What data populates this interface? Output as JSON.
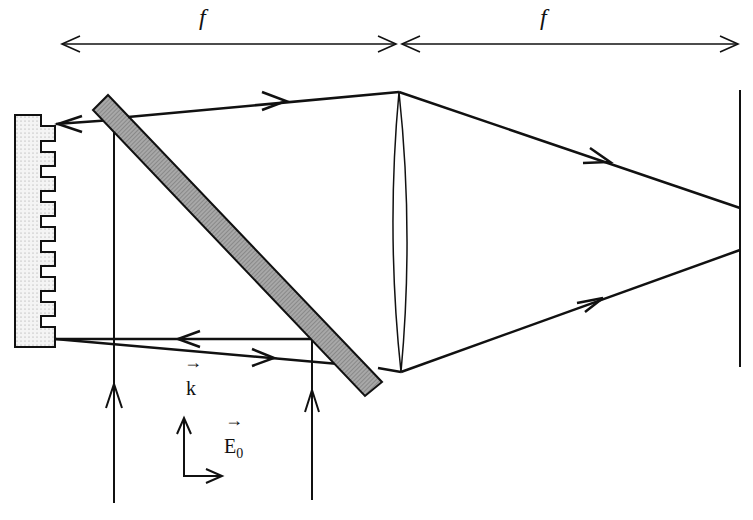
{
  "diagram": {
    "labels": {
      "focal_left": "f",
      "focal_right": "f",
      "wave_vector": "k",
      "field_amplitude": "E",
      "field_subscript": "0",
      "vector_arrow": "→"
    },
    "components": [
      "diffraction-grating",
      "beam-splitter-plate",
      "lens",
      "screen"
    ],
    "colors": {
      "ink": "#111111",
      "plate_fill": "#9a9a9a",
      "grating_fill": "#ececec"
    }
  }
}
